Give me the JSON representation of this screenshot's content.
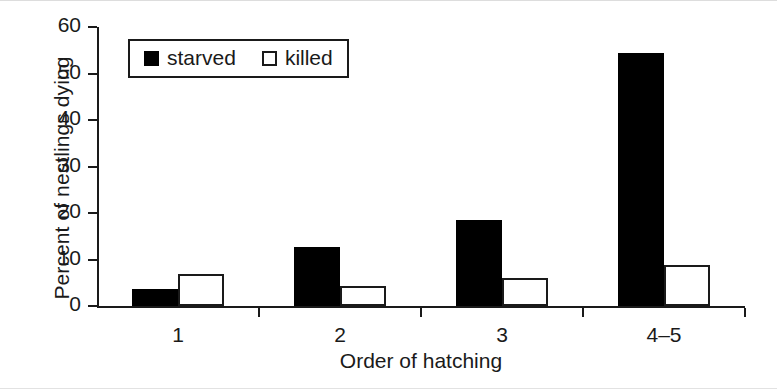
{
  "chart_data": {
    "type": "bar",
    "title": "",
    "subtitle": "",
    "xlabel": "Order of hatching",
    "ylabel": "Percent of nestlings dying",
    "categories": [
      "1",
      "2",
      "3",
      "4–5"
    ],
    "series": [
      {
        "name": "starved",
        "color": "#000000",
        "style": "filled",
        "values": [
          3.7,
          12.6,
          18.6,
          54.5
        ]
      },
      {
        "name": "killed",
        "color": "#ffffff",
        "style": "open",
        "values": [
          6.8,
          4.3,
          6.0,
          8.9
        ]
      }
    ],
    "ylim": [
      0,
      60
    ],
    "yticks": [
      0,
      10,
      20,
      30,
      40,
      50,
      60
    ],
    "ytick_labels": [
      "0",
      "10",
      "20",
      "30",
      "40",
      "50",
      "60"
    ],
    "grid": false,
    "legend_position": "top-left",
    "legend_entries": [
      "starved",
      "killed"
    ],
    "annotations": []
  },
  "legend": {
    "starved_label": "starved",
    "killed_label": "killed"
  }
}
